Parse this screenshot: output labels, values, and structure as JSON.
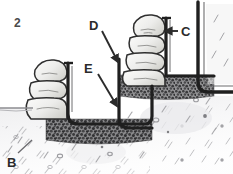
{
  "figure": {
    "number": "2",
    "caption_labels": {
      "b": "B",
      "c": "C",
      "d": "D",
      "e": "E"
    },
    "palette": {
      "ink": "#2b2b2b",
      "formwork": "#1f1f1f",
      "stone_fill": "#ededea",
      "stone_shade": "#cfcfc9",
      "gravel_dark": "#58585a",
      "gravel_mid": "#7c7c7e",
      "soil_hatch": "#b9b9bb",
      "soil_wash": "#e2e2e4",
      "background": "#ffffff"
    },
    "elements": {
      "left_stack": "stacked-stone-blocks-left",
      "upper_stack": "stacked-stone-blocks-upper",
      "gravel_lower": "gravel-base-layer-lower",
      "gravel_upper": "gravel-base-layer-upper",
      "formwork_lower": "u-shaped-formwork-lower",
      "formwork_upper": "u-shaped-formwork-upper",
      "formwork_right": "u-shaped-formwork-right-edge",
      "ground_surface": "ground-surface-line"
    },
    "label_targets": {
      "b": "gravel-base-layer-lower",
      "c": "formwork-upper-vertical-face",
      "d": "formwork-upper-back-face",
      "e": "formwork-lower-riser-face"
    }
  }
}
